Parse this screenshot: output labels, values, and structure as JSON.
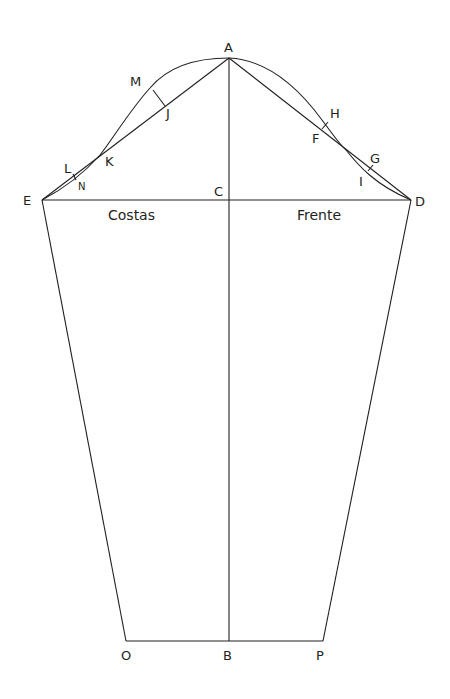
{
  "diagram": {
    "type": "sleeve-pattern-draft",
    "points": {
      "A": "A",
      "B": "B",
      "C": "C",
      "D": "D",
      "E": "E",
      "F": "F",
      "G": "G",
      "H": "H",
      "I": "I",
      "J": "J",
      "K": "K",
      "L": "L",
      "M": "M",
      "N": "N",
      "O": "O",
      "P": "P"
    },
    "regions": {
      "back": "Costas",
      "front": "Frente"
    },
    "line_color": "#231f20"
  }
}
